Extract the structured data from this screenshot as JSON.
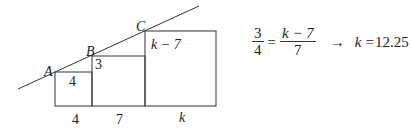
{
  "diagram": {
    "points": [
      {
        "name": "A",
        "label": "A"
      },
      {
        "name": "B",
        "label": "B"
      },
      {
        "name": "C",
        "label": "C"
      }
    ],
    "squares": [
      {
        "name": "small-square",
        "inner_label": "4",
        "base_label": "4"
      },
      {
        "name": "middle-square",
        "inner_label": "3",
        "base_label": "7"
      },
      {
        "name": "large-square",
        "inner_label": "k − 7",
        "base_label": "k"
      }
    ],
    "colors": {
      "stroke": "#333333",
      "background": "#ffffff"
    }
  },
  "equation": {
    "left_numerator": "3",
    "left_denominator": "4",
    "equals": "=",
    "right_numerator": "k − 7",
    "right_denominator": "7",
    "arrow": "→",
    "result_var": "k",
    "result_equals": "=",
    "result_value": "12.25"
  }
}
